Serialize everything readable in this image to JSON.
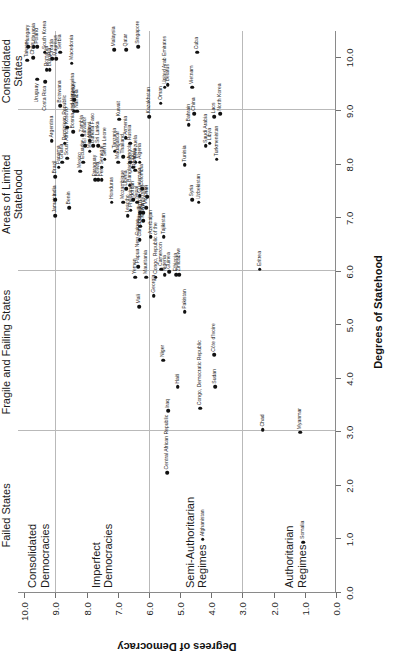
{
  "chart_data": {
    "type": "scatter",
    "title": "",
    "xlabel": "Degrees of Statehood",
    "ylabel": "Degrees of Democracy",
    "xlim": [
      0.0,
      10.5
    ],
    "ylim": [
      0.0,
      10.2
    ],
    "xticks": [
      "0.0",
      "1.0",
      "2.0",
      "3.0",
      "4.0",
      "5.0",
      "6.0",
      "7.0",
      "8.0",
      "9.0",
      "10.0"
    ],
    "xtickvals": [
      0,
      1,
      2,
      3,
      4,
      5,
      6,
      7,
      8,
      9,
      10
    ],
    "yticks": [
      "0.0",
      "1.0",
      "2.0",
      "3.0",
      "4.0",
      "5.0",
      "6.0",
      "7.0",
      "8.0",
      "9.0",
      "10.0"
    ],
    "ytickvals": [
      0,
      1,
      2,
      3,
      4,
      5,
      6,
      7,
      8,
      9,
      10
    ],
    "grid": true,
    "gridlines_x": [
      3.0,
      6.0,
      9.0
    ],
    "gridlines_y": [
      3.0,
      6.0,
      9.0
    ],
    "legend": "none",
    "x_band_labels": [
      {
        "text": "Failed States",
        "x": 1.45
      },
      {
        "text": "Fragile and Failing States",
        "x": 4.5
      },
      {
        "text": "Areas of Limited\nStatehood",
        "x": 7.45
      },
      {
        "text": "Consolidated\nStates",
        "x": 9.75
      }
    ],
    "y_band_labels": [
      {
        "text": "Consolidated\nDemocracies",
        "y": 9.55
      },
      {
        "text": "Imperfect\nDemocracies",
        "y": 7.5
      },
      {
        "text": "Semi-Authoritarian\nRegimes",
        "y": 4.5
      },
      {
        "text": "Authoritarian\nRegimes",
        "y": 1.3
      }
    ],
    "points": [
      {
        "name": "Taiwan",
        "x": 9.95,
        "y": 9.9,
        "side": "r"
      },
      {
        "name": "Hungary",
        "x": 10.2,
        "y": 9.88,
        "side": "r"
      },
      {
        "name": "Chile",
        "x": 10.0,
        "y": 9.72,
        "side": "r"
      },
      {
        "name": "Lithuania",
        "x": 10.2,
        "y": 9.7,
        "side": "r"
      },
      {
        "name": "Poland",
        "x": 10.2,
        "y": 9.58,
        "side": "r"
      },
      {
        "name": "Uruguay",
        "x": 9.6,
        "y": 9.58,
        "side": "l"
      },
      {
        "name": "Costa Rica",
        "x": 9.55,
        "y": 9.32,
        "side": "l"
      },
      {
        "name": "South Korea",
        "x": 10.1,
        "y": 9.35,
        "side": "r"
      },
      {
        "name": "Romania",
        "x": 9.78,
        "y": 9.28,
        "side": "r"
      },
      {
        "name": "Bulgaria",
        "x": 9.78,
        "y": 9.18,
        "side": "r"
      },
      {
        "name": "Croatia",
        "x": 9.98,
        "y": 9.1,
        "side": "r"
      },
      {
        "name": "Mauritius",
        "x": 9.98,
        "y": 8.98,
        "side": "r"
      },
      {
        "name": "Serbia",
        "x": 10.1,
        "y": 8.85,
        "side": "r"
      },
      {
        "name": "Macedonia",
        "x": 9.9,
        "y": 8.48,
        "side": "r"
      },
      {
        "name": "Jamaica",
        "x": 7.05,
        "y": 9.0,
        "side": "r"
      },
      {
        "name": "Argentina",
        "x": 8.45,
        "y": 9.12,
        "side": "r"
      },
      {
        "name": "India",
        "x": 7.35,
        "y": 9.0,
        "side": "r"
      },
      {
        "name": "Brazil",
        "x": 7.78,
        "y": 9.0,
        "side": "r"
      },
      {
        "name": "Panama",
        "x": 7.95,
        "y": 8.9,
        "side": "r"
      },
      {
        "name": "Ghana",
        "x": 8.05,
        "y": 8.78,
        "side": "r"
      },
      {
        "name": "Botswana",
        "x": 9.1,
        "y": 8.85,
        "side": "r"
      },
      {
        "name": "Dominican Republic",
        "x": 8.4,
        "y": 8.7,
        "side": "r"
      },
      {
        "name": "Kosovo",
        "x": 8.7,
        "y": 8.62,
        "side": "r"
      },
      {
        "name": "South Africa",
        "x": 8.12,
        "y": 8.62,
        "side": "r"
      },
      {
        "name": "Bosnia and Herzegovina",
        "x": 8.62,
        "y": 8.42,
        "side": "r"
      },
      {
        "name": "Ukraine",
        "x": 9.0,
        "y": 8.4,
        "side": "r"
      },
      {
        "name": "Turkey",
        "x": 9.22,
        "y": 8.4,
        "side": "r"
      },
      {
        "name": "Namibia",
        "x": 9.0,
        "y": 8.3,
        "side": "r"
      },
      {
        "name": "Benin",
        "x": 7.2,
        "y": 8.55,
        "side": "r"
      },
      {
        "name": "Mexico",
        "x": 7.88,
        "y": 8.2,
        "side": "r"
      },
      {
        "name": "Ecuador",
        "x": 8.05,
        "y": 8.1,
        "side": "r"
      },
      {
        "name": "El Salvador",
        "x": 8.35,
        "y": 8.05,
        "side": "r"
      },
      {
        "name": "Zambia",
        "x": 8.55,
        "y": 8.15,
        "side": "r"
      },
      {
        "name": "Mongolia",
        "x": 8.25,
        "y": 7.9,
        "side": "r"
      },
      {
        "name": "Malawi",
        "x": 8.45,
        "y": 7.9,
        "side": "r"
      },
      {
        "name": "Burkina Faso",
        "x": 8.35,
        "y": 7.78,
        "side": "r"
      },
      {
        "name": "Sri Lanka",
        "x": 8.35,
        "y": 7.62,
        "side": "r"
      },
      {
        "name": "Paraguay",
        "x": 7.72,
        "y": 7.72,
        "side": "r"
      },
      {
        "name": "Bolivia",
        "x": 7.72,
        "y": 7.62,
        "side": "r"
      },
      {
        "name": "Peru",
        "x": 7.72,
        "y": 7.52,
        "side": "r"
      },
      {
        "name": "Senegal",
        "x": 7.95,
        "y": 7.52,
        "side": "r"
      },
      {
        "name": "Sierra Leone",
        "x": 8.1,
        "y": 7.42,
        "side": "r"
      },
      {
        "name": "Tanzania",
        "x": 8.25,
        "y": 7.1,
        "side": "r"
      },
      {
        "name": "Madagascar",
        "x": 8.05,
        "y": 6.98,
        "side": "r"
      },
      {
        "name": "Thailand",
        "x": 8.15,
        "y": 6.82,
        "side": "r"
      },
      {
        "name": "Angola",
        "x": 8.05,
        "y": 6.6,
        "side": "r"
      },
      {
        "name": "Russia",
        "x": 8.4,
        "y": 6.6,
        "side": "r"
      },
      {
        "name": "Togo",
        "x": 7.95,
        "y": 6.5,
        "side": "r"
      },
      {
        "name": "Venezuela",
        "x": 8.05,
        "y": 6.42,
        "side": "r"
      },
      {
        "name": "Algeria",
        "x": 8.05,
        "y": 6.3,
        "side": "r"
      },
      {
        "name": "Honduras",
        "x": 7.3,
        "y": 7.2,
        "side": "r"
      },
      {
        "name": "Mozambique",
        "x": 7.3,
        "y": 6.82,
        "side": "r"
      },
      {
        "name": "Liberia",
        "x": 7.55,
        "y": 6.72,
        "side": "r"
      },
      {
        "name": "Bangladesh",
        "x": 7.62,
        "y": 6.62,
        "side": "r"
      },
      {
        "name": "Nepal",
        "x": 7.3,
        "y": 6.38,
        "side": "r"
      },
      {
        "name": "Guatemala",
        "x": 7.42,
        "y": 6.3,
        "side": "r"
      },
      {
        "name": "Colombia",
        "x": 7.55,
        "y": 6.22,
        "side": "r"
      },
      {
        "name": "Lesotho",
        "x": 7.05,
        "y": 6.68,
        "side": "r"
      },
      {
        "name": "Philippines",
        "x": 7.15,
        "y": 6.58,
        "side": "r"
      },
      {
        "name": "Burundi",
        "x": 6.85,
        "y": 6.28,
        "side": "r"
      },
      {
        "name": "Kenya",
        "x": 6.95,
        "y": 6.18,
        "side": "r"
      },
      {
        "name": "Papua New Guinea",
        "x": 6.1,
        "y": 6.35,
        "side": "r"
      },
      {
        "name": "Mali",
        "x": 5.35,
        "y": 6.32,
        "side": "r"
      },
      {
        "name": "Georgia",
        "x": 5.55,
        "y": 5.85,
        "side": "r"
      },
      {
        "name": "Niger",
        "x": 4.35,
        "y": 5.55,
        "side": "r"
      },
      {
        "name": "Nigeria",
        "x": 5.95,
        "y": 5.5,
        "side": "r"
      },
      {
        "name": "Pakistan",
        "x": 5.25,
        "y": 4.85,
        "side": "r"
      },
      {
        "name": "Haiti",
        "x": 3.85,
        "y": 5.08,
        "side": "r"
      },
      {
        "name": "Iraq",
        "x": 3.4,
        "y": 5.38,
        "side": "r"
      },
      {
        "name": "Central African Republic",
        "x": 2.25,
        "y": 5.42,
        "side": "r"
      },
      {
        "name": "Congo, Democratic Republic",
        "x": 3.45,
        "y": 4.35,
        "side": "r"
      },
      {
        "name": "Sudan",
        "x": 3.85,
        "y": 3.88,
        "side": "r"
      },
      {
        "name": "Côte d'Ivoire",
        "x": 4.45,
        "y": 3.9,
        "side": "r"
      },
      {
        "name": "Chad",
        "x": 3.05,
        "y": 2.35,
        "side": "r"
      },
      {
        "name": "Myanmar",
        "x": 3.0,
        "y": 1.15,
        "side": "r"
      },
      {
        "name": "Afghanistan",
        "x": 1.0,
        "y": 4.28,
        "side": "r"
      },
      {
        "name": "Somalia",
        "x": 0.95,
        "y": 1.05,
        "side": "r"
      },
      {
        "name": "Yemen",
        "x": 5.9,
        "y": 6.45,
        "side": "r"
      },
      {
        "name": "Mauritania",
        "x": 5.9,
        "y": 6.08,
        "side": "r"
      },
      {
        "name": "Congo, Republic of the",
        "x": 5.9,
        "y": 5.78,
        "side": "r"
      },
      {
        "name": "Cameroon",
        "x": 6.05,
        "y": 5.6,
        "side": "r"
      },
      {
        "name": "Guinea",
        "x": 6.0,
        "y": 5.35,
        "side": "r"
      },
      {
        "name": "Ethiopia",
        "x": 5.95,
        "y": 5.12,
        "side": "r"
      },
      {
        "name": "Zimbabwe",
        "x": 5.95,
        "y": 5.02,
        "side": "r"
      },
      {
        "name": "Eritrea",
        "x": 6.05,
        "y": 2.45,
        "side": "r"
      },
      {
        "name": "Cambodia",
        "x": 6.6,
        "y": 6.3,
        "side": "r"
      },
      {
        "name": "Egypt",
        "x": 7.1,
        "y": 6.28,
        "side": "r"
      },
      {
        "name": "Kyrgyzstan",
        "x": 7.1,
        "y": 6.18,
        "side": "r"
      },
      {
        "name": "Morocco",
        "x": 7.2,
        "y": 6.08,
        "side": "r"
      },
      {
        "name": "Jordan",
        "x": 7.35,
        "y": 6.5,
        "side": "r"
      },
      {
        "name": "Iran",
        "x": 7.4,
        "y": 6.05,
        "side": "r"
      },
      {
        "name": "Azerbaijan",
        "x": 6.65,
        "y": 5.95,
        "side": "r"
      },
      {
        "name": "Rwanda",
        "x": 7.9,
        "y": 6.45,
        "side": "r"
      },
      {
        "name": "Tajikistan",
        "x": 6.65,
        "y": 5.52,
        "side": "r"
      },
      {
        "name": "Kuwait",
        "x": 8.85,
        "y": 6.95,
        "side": "r"
      },
      {
        "name": "Armenia",
        "x": 8.5,
        "y": 6.75,
        "side": "r"
      },
      {
        "name": "Kazakhstan",
        "x": 8.9,
        "y": 6.0,
        "side": "r"
      },
      {
        "name": "Oman",
        "x": 9.15,
        "y": 5.62,
        "side": "r"
      },
      {
        "name": "United Arab Emirates",
        "x": 9.45,
        "y": 5.5,
        "side": "r"
      },
      {
        "name": "Belarus",
        "x": 9.5,
        "y": 5.4,
        "side": "r"
      },
      {
        "name": "Tunisia",
        "x": 8.0,
        "y": 4.85,
        "side": "r"
      },
      {
        "name": "Syria",
        "x": 7.35,
        "y": 4.62,
        "side": "r"
      },
      {
        "name": "Uzbekistan",
        "x": 7.3,
        "y": 4.4,
        "side": "r"
      },
      {
        "name": "Bahrain",
        "x": 8.75,
        "y": 4.72,
        "side": "r"
      },
      {
        "name": "China",
        "x": 8.95,
        "y": 4.55,
        "side": "r"
      },
      {
        "name": "Vietnam",
        "x": 9.45,
        "y": 4.62,
        "side": "r"
      },
      {
        "name": "Saudi Arabia",
        "x": 8.35,
        "y": 4.18,
        "side": "r"
      },
      {
        "name": "Libya",
        "x": 8.4,
        "y": 4.05,
        "side": "r"
      },
      {
        "name": "Turkmenistan",
        "x": 8.1,
        "y": 3.82,
        "side": "r"
      },
      {
        "name": "Laos",
        "x": 8.9,
        "y": 3.9,
        "side": "r"
      },
      {
        "name": "North Korea",
        "x": 8.95,
        "y": 3.72,
        "side": "r"
      },
      {
        "name": "Malaysia",
        "x": 10.15,
        "y": 7.12,
        "side": "r"
      },
      {
        "name": "Qatar",
        "x": 10.15,
        "y": 6.72,
        "side": "r"
      },
      {
        "name": "Singapore",
        "x": 10.2,
        "y": 6.35,
        "side": "r"
      },
      {
        "name": "Cuba",
        "x": 10.1,
        "y": 4.45,
        "side": "r"
      }
    ]
  },
  "caption": ""
}
